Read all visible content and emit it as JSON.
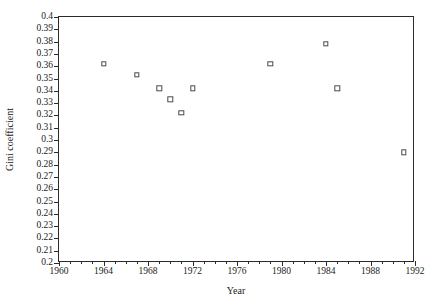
{
  "chart_data": {
    "type": "scatter",
    "title": "",
    "xlabel": "Year",
    "ylabel": "Gini coefficient",
    "xlim": [
      1960,
      1992
    ],
    "ylim": [
      0.2,
      0.4
    ],
    "grid": false,
    "legend": null,
    "x_tick_step_major": 4,
    "x_tick_step_minor": 1,
    "y_tick_step_major": 0.01,
    "x_ticks": [
      1960,
      1964,
      1968,
      1972,
      1976,
      1980,
      1984,
      1988,
      1992
    ],
    "x_tick_labels": [
      "1960",
      "1964",
      "1968",
      "1972",
      "1976",
      "1980",
      "1984",
      "1988",
      "1992"
    ],
    "y_ticks": [
      0.2,
      0.21,
      0.22,
      0.23,
      0.24,
      0.25,
      0.26,
      0.27,
      0.28,
      0.29,
      0.3,
      0.31,
      0.32,
      0.33,
      0.34,
      0.35,
      0.36,
      0.37,
      0.38,
      0.39,
      0.4
    ],
    "y_tick_labels": [
      "0.2",
      "0.21",
      "0.22",
      "0.23",
      "0.24",
      "0.25",
      "0.26",
      "0.27",
      "0.28",
      "0.29",
      "0.3",
      "0.31",
      "0.32",
      "0.33",
      "0.34",
      "0.35",
      "0.36",
      "0.37",
      "0.38",
      "0.39",
      "0.4"
    ],
    "marker_style": "open-square",
    "marker_color": "#4a4a4a",
    "points": [
      {
        "x": 1964,
        "y": 0.362
      },
      {
        "x": 1967,
        "y": 0.353
      },
      {
        "x": 1969,
        "y": 0.342
      },
      {
        "x": 1970,
        "y": 0.333
      },
      {
        "x": 1971,
        "y": 0.322
      },
      {
        "x": 1972,
        "y": 0.342
      },
      {
        "x": 1979,
        "y": 0.362
      },
      {
        "x": 1984,
        "y": 0.378
      },
      {
        "x": 1985,
        "y": 0.342
      },
      {
        "x": 1991,
        "y": 0.29
      }
    ]
  }
}
